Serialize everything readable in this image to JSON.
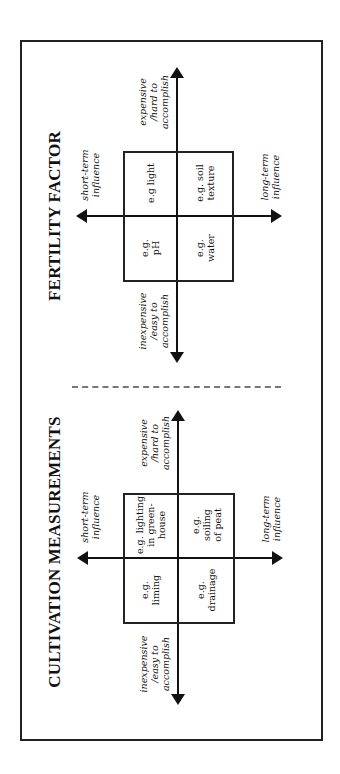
{
  "diagrams": {
    "fertility": {
      "title": "FERTILITY FACTOR",
      "axis_labels": {
        "short_term": [
          "short-term",
          "influence"
        ],
        "long_term": [
          "long-term",
          "influence"
        ],
        "expensive": [
          "expensive",
          "/hard to",
          "accomplish"
        ],
        "inexpensive": [
          "inexpensive",
          "/easy to",
          "accomplish"
        ]
      },
      "cells": {
        "short_expensive": [
          "e.g light"
        ],
        "long_expensive": [
          "e.g. soil",
          "texture"
        ],
        "short_inexpensive": [
          "e.g.",
          "pH"
        ],
        "long_inexpensive": [
          "e.g.",
          "water"
        ]
      }
    },
    "cultivation": {
      "title": "CULTIVATION MEASUREMENTS",
      "axis_labels": {
        "short_term": [
          "short-term",
          "influence"
        ],
        "long_term": [
          "long-term",
          "influence"
        ],
        "expensive": [
          "expensive",
          "/hard to",
          "accomplish"
        ],
        "inexpensive": [
          "inexpensive",
          "/easy to",
          "accomplish"
        ]
      },
      "cells": {
        "short_expensive": [
          "e.g. lighting",
          "in green-",
          "house"
        ],
        "long_expensive": [
          "e.g.",
          "soiling",
          "of peat"
        ],
        "short_inexpensive": [
          "e.g.",
          "liming"
        ],
        "long_inexpensive": [
          "e.g.",
          "drainage"
        ]
      }
    }
  },
  "colors": {
    "line": "#111111",
    "frame": "#222222",
    "divider": "#777777",
    "background": "#ffffff"
  }
}
